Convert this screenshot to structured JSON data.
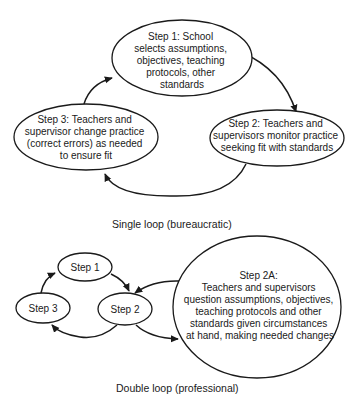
{
  "single_loop": {
    "caption": "Single loop (bureaucratic)",
    "step1": {
      "lines": [
        "Step 1:  School",
        "selects assumptions,",
        "objectives, teaching",
        "protocols, other",
        "standards"
      ]
    },
    "step2": {
      "lines": [
        "Step 2:  Teachers and",
        "supervisors monitor practice",
        "seeking fit with standards"
      ]
    },
    "step3": {
      "lines": [
        "Step 3:  Teachers and",
        "supervisor change practice",
        "(correct errors) as needed",
        "to ensure fit"
      ]
    }
  },
  "double_loop": {
    "caption": "Double loop (professional)",
    "step1": {
      "label": "Step 1"
    },
    "step2": {
      "label": "Step 2"
    },
    "step3": {
      "label": "Step 3"
    },
    "step2a": {
      "lines": [
        "Step 2A:",
        "Teachers and supervisors",
        "question assumptions, objectives,",
        "teaching protocols and other",
        "standards given circumstances",
        "at hand, making needed changes"
      ]
    }
  },
  "colors": {
    "ink": "#1a1a1a",
    "background": "#ffffff"
  }
}
